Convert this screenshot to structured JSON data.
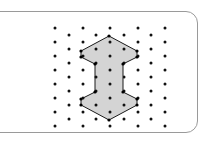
{
  "panel": {
    "name": "rounded-panel",
    "border_color": "#9a9a9a",
    "background_color": "#ffffff",
    "corner_radius": 12,
    "x": -28,
    "y": 11,
    "width": 226,
    "height": 122
  },
  "figure": {
    "title": "",
    "caption": "",
    "shape": {
      "name": "i-beam-polygon",
      "fill_color": "#d4d4d4",
      "stroke_color": "#1a1a1a",
      "stroke_width": 1,
      "vertices": [
        [
          109,
          36
        ],
        [
          137,
          51
        ],
        [
          137,
          57
        ],
        [
          123,
          64
        ],
        [
          123,
          92
        ],
        [
          137,
          99
        ],
        [
          137,
          105
        ],
        [
          109,
          120
        ],
        [
          81,
          105
        ],
        [
          81,
          99
        ],
        [
          95,
          92
        ],
        [
          95,
          64
        ],
        [
          81,
          57
        ],
        [
          81,
          51
        ]
      ],
      "vertex_marker_radius": 1.6,
      "vertex_marker_color": "#000000"
    },
    "lattice": {
      "name": "staggered-dot-grid",
      "dot_color": "#111111",
      "dot_radius": 1.5,
      "columns_even_x": [
        55,
        83,
        110,
        138,
        165
      ],
      "columns_odd_x": [
        69,
        96,
        124,
        151
      ],
      "rows_even_y": [
        28,
        42,
        56,
        70,
        84,
        98,
        112,
        126
      ],
      "rows_odd_y": [
        35,
        49,
        63,
        77,
        91,
        105,
        119
      ],
      "description": "Two interleaved rectangular sub-lattices forming a staggered pattern"
    }
  }
}
